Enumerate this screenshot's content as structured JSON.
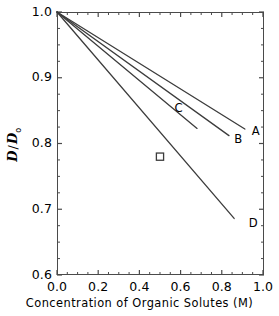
{
  "chart_data": {
    "type": "line",
    "title": "",
    "xlabel": "Concentration of Organic Solutes (M)",
    "ylabel": "D/D0",
    "ylabel_parts": {
      "numerator": "D",
      "separator": "/",
      "denominator": "D",
      "subscript": "o"
    },
    "xlim": [
      0.0,
      1.005
    ],
    "ylim": [
      0.6,
      1.0
    ],
    "xticks": [
      "0.0",
      "0.2",
      "0.4",
      "0.6",
      "0.8",
      "1.0"
    ],
    "xtick_values": [
      0.0,
      0.2,
      0.4,
      0.6,
      0.8,
      1.0
    ],
    "yticks": [
      "0.6",
      "0.7",
      "0.8",
      "0.9",
      "1.0"
    ],
    "ytick_values": [
      0.6,
      0.7,
      0.8,
      0.9,
      1.0
    ],
    "x_minor_step": 0.05,
    "y_minor_step": 0.025,
    "grid": false,
    "legend": "inline-end-labels",
    "line_color": "#3c3c3c",
    "frame_color": "#4a4a4a",
    "series": [
      {
        "name": "A",
        "label": "A",
        "x": [
          0.0,
          0.912
        ],
        "y": [
          1.0,
          0.822
        ],
        "slope_per_M": -0.195,
        "label_pos": {
          "x": 0.96,
          "y": 0.818
        }
      },
      {
        "name": "B",
        "label": "B",
        "x": [
          0.0,
          0.835
        ],
        "y": [
          1.0,
          0.812
        ],
        "slope_per_M": -0.225,
        "label_pos": {
          "x": 0.875,
          "y": 0.806
        }
      },
      {
        "name": "C",
        "label": "C",
        "x": [
          0.0,
          0.68
        ],
        "y": [
          1.0,
          0.823
        ],
        "slope_per_M": -0.26,
        "label_pos": {
          "x": 0.585,
          "y": 0.852
        }
      },
      {
        "name": "D",
        "label": "D",
        "x": [
          0.0,
          0.86
        ],
        "y": [
          1.0,
          0.686
        ],
        "slope_per_M": -0.365,
        "label_pos": {
          "x": 0.945,
          "y": 0.677
        }
      }
    ],
    "points": [
      {
        "name": "experimental-point",
        "marker": "open-square",
        "x": 0.5,
        "y": 0.78
      }
    ]
  }
}
